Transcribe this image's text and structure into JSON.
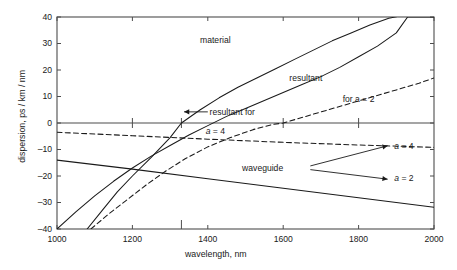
{
  "chart_data": {
    "type": "line",
    "title": "",
    "xlabel": "wavelength, nm",
    "ylabel": "dispersion, ps / km / nm",
    "xlim": [
      1000,
      2000
    ],
    "ylim": [
      -40,
      40
    ],
    "xticks": [
      1000,
      1200,
      1400,
      1600,
      1800,
      2000
    ],
    "xticklabels": [
      "1000",
      "1200",
      "1400",
      "1600",
      "1800",
      "2000"
    ],
    "yticks": [
      -40,
      -30,
      -20,
      -10,
      0,
      10,
      20,
      30,
      40
    ],
    "yticklabels": [
      "-40",
      "-30",
      "-20",
      "-10",
      "0",
      "10",
      "20",
      "30",
      "40"
    ],
    "grid": false,
    "legend": "none (inline annotations)",
    "zero_line": true,
    "zero_line_ticks": [
      1200,
      1330,
      1600,
      1800
    ],
    "axis_special_tick": 1330,
    "series": [
      {
        "name": "material",
        "style": "solid",
        "label": "material",
        "x": [
          1000,
          1050,
          1100,
          1150,
          1200,
          1250,
          1300,
          1350,
          1400,
          1450,
          1500,
          1550,
          1600,
          1650,
          1700,
          1750,
          1800,
          1850,
          1900,
          1930,
          2000
        ],
        "y": [
          -40,
          -33.5,
          -27.5,
          -22,
          -17,
          -12.5,
          -8.5,
          -4.5,
          -1,
          2.5,
          5.5,
          8.5,
          11.5,
          14.5,
          17.5,
          21,
          25,
          29,
          34,
          40,
          40
        ]
      },
      {
        "name": "resultant for a = 4",
        "style": "solid",
        "label": "resultant for",
        "label2": "a = 4",
        "x": [
          1080,
          1120,
          1160,
          1200,
          1250,
          1300,
          1330,
          1380,
          1430,
          1480,
          1530,
          1580,
          1630,
          1680,
          1730,
          1780,
          1830,
          1880,
          1930,
          1975
        ],
        "y": [
          -40,
          -33,
          -26,
          -20,
          -13,
          -5.5,
          0,
          5,
          9.5,
          13.5,
          17,
          20.5,
          24,
          27.5,
          31,
          34,
          37,
          39.5,
          41,
          42
        ]
      },
      {
        "name": "resultant for a = 2",
        "style": "dashed",
        "label": "resultant",
        "label2": "for a = 2",
        "x": [
          1090,
          1140,
          1190,
          1240,
          1290,
          1340,
          1400,
          1460,
          1520,
          1570,
          1600,
          1660,
          1720,
          1780,
          1840,
          1900,
          1960,
          2000
        ],
        "y": [
          -40,
          -34,
          -28.5,
          -23,
          -18,
          -13.5,
          -9,
          -5.5,
          -2.5,
          -0.6,
          0,
          2.5,
          5,
          7.5,
          10,
          12.5,
          15,
          17
        ]
      },
      {
        "name": "waveguide a = 4",
        "style": "dashed",
        "label": "a = 4",
        "x": [
          1000,
          1200,
          1400,
          1600,
          1800,
          2000
        ],
        "y": [
          -3.5,
          -4.8,
          -6.1,
          -7.3,
          -8.3,
          -9.2
        ]
      },
      {
        "name": "waveguide a = 2",
        "style": "solid",
        "label": "a = 2",
        "x": [
          1000,
          1200,
          1400,
          1600,
          1800,
          2000
        ],
        "y": [
          -14.0,
          -17.4,
          -21.0,
          -24.6,
          -28.2,
          -31.8
        ]
      }
    ],
    "annotations": [
      {
        "name": "material-label",
        "text": "material",
        "x": 1420,
        "y": 31
      },
      {
        "name": "resultant-label",
        "text": "resultant",
        "x": 1660,
        "y": 17
      },
      {
        "name": "for-a2-label",
        "text": "for a = 2",
        "x": 1800,
        "y": 9
      },
      {
        "name": "resultant-for-label",
        "text": "resultant for",
        "x": 1410,
        "y": 4
      },
      {
        "name": "a4-inline-label",
        "text": "a = 4",
        "x": 1420,
        "y": -3
      },
      {
        "name": "waveguide-label",
        "text": "waveguide",
        "x": 1600,
        "y": -17
      },
      {
        "name": "waveguide-a4-label",
        "text": "a = 4",
        "x": 1900,
        "y": -9
      },
      {
        "name": "waveguide-a2-label",
        "text": "a = 2",
        "x": 1900,
        "y": -21
      }
    ],
    "colors": {
      "line": "#1a1a1a",
      "axis": "#4d4d4d",
      "text": "#1a1a1a",
      "background": "#ffffff"
    }
  }
}
